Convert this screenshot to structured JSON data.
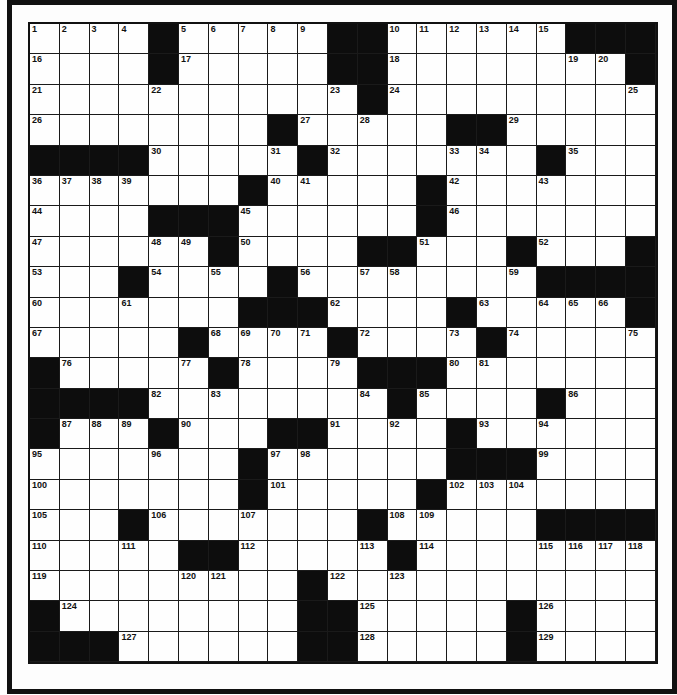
{
  "puzzle": {
    "rows": 21,
    "cols": 21,
    "colors": {
      "block": "#0d0d0d",
      "cell": "#fefefe",
      "line": "#1a1a1a"
    },
    "grid": [
      [
        "1",
        "2",
        "3",
        "4",
        "#",
        "5",
        "6",
        "7",
        "8",
        "9",
        "#",
        "#",
        "10",
        "11",
        "12",
        "13",
        "14",
        "15",
        "#",
        "#",
        "#"
      ],
      [
        "16",
        "",
        "",
        "",
        "#",
        "17",
        "",
        "",
        "",
        "",
        "#",
        "#",
        "18",
        "",
        "",
        "",
        "",
        "",
        "19",
        "20",
        "#"
      ],
      [
        "21",
        "",
        "",
        "",
        "22",
        "",
        "",
        "",
        "",
        "",
        "23",
        "#",
        "24",
        "",
        "",
        "",
        "",
        "",
        "",
        "",
        "25"
      ],
      [
        "26",
        "",
        "",
        "",
        "",
        "",
        "",
        "",
        "#",
        "27",
        "",
        "28",
        "",
        "",
        "#",
        "#",
        "29",
        "",
        "",
        "",
        ""
      ],
      [
        "#",
        "#",
        "#",
        "#",
        "30",
        "",
        "",
        "",
        "31",
        "#",
        "32",
        "",
        "",
        "",
        "33",
        "34",
        "",
        "#",
        "35",
        "",
        ""
      ],
      [
        "36",
        "37",
        "38",
        "39",
        "",
        "",
        "",
        "#",
        "40",
        "41",
        "",
        "",
        "",
        "#",
        "42",
        "",
        "",
        "43",
        "",
        "",
        ""
      ],
      [
        "44",
        "",
        "",
        "",
        "#",
        "#",
        "#",
        "45",
        "",
        "",
        "",
        "",
        "",
        "#",
        "46",
        "",
        "",
        "",
        "",
        "",
        ""
      ],
      [
        "47",
        "",
        "",
        "",
        "48",
        "49",
        "#",
        "50",
        "",
        "",
        "",
        "#",
        "#",
        "51",
        "",
        "",
        "#",
        "52",
        "",
        "",
        "#"
      ],
      [
        "53",
        "",
        "",
        "#",
        "54",
        "",
        "55",
        "",
        "#",
        "56",
        "",
        "57",
        "58",
        "",
        "",
        "",
        "59",
        "#",
        "#",
        "#",
        "#"
      ],
      [
        "60",
        "",
        "",
        "61",
        "",
        "",
        "",
        "#",
        "#",
        "#",
        "62",
        "",
        "",
        "",
        "#",
        "63",
        "",
        "64",
        "65",
        "66",
        "#"
      ],
      [
        "67",
        "",
        "",
        "",
        "",
        "#",
        "68",
        "69",
        "70",
        "71",
        "#",
        "72",
        "",
        "",
        "73",
        "#",
        "74",
        "",
        "",
        "",
        "75"
      ],
      [
        "#",
        "76",
        "",
        "",
        "",
        "77",
        "#",
        "78",
        "",
        "",
        "79",
        "#",
        "#",
        "#",
        "80",
        "81",
        "",
        "",
        "",
        "",
        ""
      ],
      [
        "#",
        "#",
        "#",
        "#",
        "82",
        "",
        "83",
        "",
        "",
        "",
        "",
        "84",
        "#",
        "85",
        "",
        "",
        "",
        "#",
        "86",
        "",
        ""
      ],
      [
        "#",
        "87",
        "88",
        "89",
        "#",
        "90",
        "",
        "",
        "#",
        "#",
        "91",
        "",
        "92",
        "",
        "#",
        "93",
        "",
        "94",
        "",
        "",
        ""
      ],
      [
        "95",
        "",
        "",
        "",
        "96",
        "",
        "",
        "#",
        "97",
        "98",
        "",
        "",
        "",
        "",
        "#",
        "#",
        "#",
        "99",
        "",
        "",
        ""
      ],
      [
        "100",
        "",
        "",
        "",
        "",
        "",
        "",
        "#",
        "101",
        "",
        "",
        "",
        "",
        "#",
        "102",
        "103",
        "104",
        "",
        "",
        "",
        ""
      ],
      [
        "105",
        "",
        "",
        "#",
        "106",
        "",
        "",
        "107",
        "",
        "",
        "",
        "#",
        "108",
        "109",
        "",
        "",
        "",
        "#",
        "#",
        "#",
        "#"
      ],
      [
        "110",
        "",
        "",
        "111",
        "",
        "#",
        "#",
        "112",
        "",
        "",
        "",
        "113",
        "#",
        "114",
        "",
        "",
        "",
        "115",
        "116",
        "117",
        "118"
      ],
      [
        "119",
        "",
        "",
        "",
        "",
        "120",
        "121",
        "",
        "",
        "#",
        "122",
        "",
        "123",
        "",
        "",
        "",
        "",
        "",
        "",
        "",
        ""
      ],
      [
        "#",
        "124",
        "",
        "",
        "",
        "",
        "",
        "",
        "",
        "#",
        "#",
        "125",
        "",
        "",
        "",
        "",
        "#",
        "126",
        "",
        "",
        ""
      ],
      [
        "#",
        "#",
        "#",
        "127",
        "",
        "",
        "",
        "",
        "",
        "#",
        "#",
        "128",
        "",
        "",
        "",
        "",
        "#",
        "129",
        "",
        "",
        ""
      ]
    ]
  }
}
